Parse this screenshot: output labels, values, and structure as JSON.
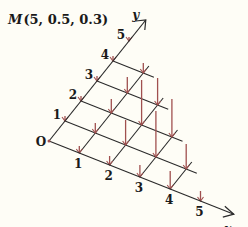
{
  "title": {
    "point_label": "M",
    "coords_text": "(5,  0.5,  0.3)"
  },
  "axes": {
    "origin_label": "O",
    "x_label": "x",
    "y_label": "y",
    "x_ticks": [
      "1",
      "2",
      "3",
      "4",
      "5"
    ],
    "y_ticks": [
      "1",
      "2",
      "3",
      "4",
      "5"
    ]
  },
  "colors": {
    "grid": "#2a2a2a",
    "arrows": "#a0504f",
    "background": "#fefdf6"
  },
  "grid": {
    "extent": 5,
    "shape": "triangular (x + y <= 5)"
  },
  "arrows": [
    {
      "x": 1,
      "y": 0,
      "h": 7
    },
    {
      "x": 2,
      "y": 0,
      "h": 9
    },
    {
      "x": 3,
      "y": 0,
      "h": 12
    },
    {
      "x": 4,
      "y": 0,
      "h": 18
    },
    {
      "x": 5,
      "y": 0,
      "h": 10
    },
    {
      "x": 0,
      "y": 1,
      "h": 5
    },
    {
      "x": 1,
      "y": 1,
      "h": 10
    },
    {
      "x": 2,
      "y": 1,
      "h": 25
    },
    {
      "x": 3,
      "y": 1,
      "h": 46
    },
    {
      "x": 4,
      "y": 1,
      "h": 25
    },
    {
      "x": 0,
      "y": 2,
      "h": 5
    },
    {
      "x": 1,
      "y": 2,
      "h": 14
    },
    {
      "x": 2,
      "y": 2,
      "h": 45
    },
    {
      "x": 3,
      "y": 2,
      "h": 38
    },
    {
      "x": 0,
      "y": 3,
      "h": 5
    },
    {
      "x": 1,
      "y": 3,
      "h": 16
    },
    {
      "x": 2,
      "y": 3,
      "h": 27
    },
    {
      "x": 0,
      "y": 4,
      "h": 5
    },
    {
      "x": 1,
      "y": 4,
      "h": 10
    },
    {
      "x": 0,
      "y": 5,
      "h": 4
    }
  ]
}
